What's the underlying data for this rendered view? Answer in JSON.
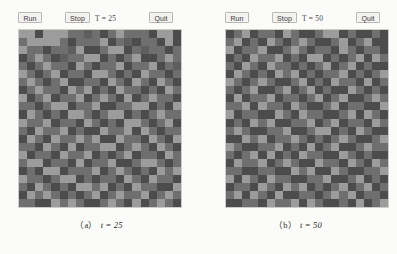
{
  "figure": {
    "panels": [
      {
        "id": "a",
        "caption_index": "（a）",
        "caption_text": "t = 25",
        "toolbar": {
          "run_label": "Run",
          "stop_label": "Stop",
          "quit_label": "Quit",
          "time_label": "T = 25"
        },
        "grid": {
          "columns": 20,
          "rows": 22,
          "palette": [
            "#4c4c4c",
            "#6f6f6f",
            "#9c9c9c",
            "#5e5e5e",
            "#868686"
          ],
          "cells": [
            2,
            2,
            0,
            2,
            2,
            2,
            1,
            1,
            3,
            1,
            0,
            1,
            2,
            1,
            1,
            1,
            0,
            2,
            2,
            0,
            1,
            2,
            2,
            2,
            2,
            1,
            0,
            1,
            1,
            1,
            2,
            0,
            1,
            3,
            0,
            1,
            1,
            0,
            2,
            0,
            2,
            1,
            1,
            0,
            1,
            1,
            3,
            2,
            0,
            0,
            1,
            2,
            2,
            0,
            1,
            3,
            1,
            1,
            0,
            1,
            0,
            1,
            2,
            1,
            0,
            3,
            1,
            1,
            2,
            2,
            0,
            1,
            0,
            1,
            2,
            0,
            0,
            1,
            2,
            1,
            1,
            0,
            1,
            2,
            1,
            1,
            0,
            2,
            1,
            0,
            1,
            1,
            2,
            0,
            1,
            1,
            2,
            0,
            1,
            3,
            2,
            1,
            0,
            1,
            2,
            0,
            1,
            1,
            0,
            2,
            2,
            1,
            0,
            1,
            0,
            2,
            1,
            1,
            0,
            1,
            1,
            2,
            1,
            0,
            1,
            2,
            0,
            0,
            1,
            1,
            0,
            2,
            1,
            0,
            2,
            1,
            0,
            2,
            1,
            0,
            0,
            1,
            2,
            1,
            1,
            0,
            2,
            1,
            2,
            0,
            1,
            0,
            2,
            1,
            1,
            0,
            1,
            0,
            2,
            1,
            2,
            0,
            1,
            2,
            0,
            1,
            1,
            2,
            0,
            1,
            2,
            1,
            0,
            2,
            0,
            1,
            2,
            1,
            1,
            0,
            1,
            1,
            0,
            1,
            2,
            2,
            0,
            1,
            1,
            2,
            0,
            0,
            1,
            1,
            2,
            2,
            0,
            1,
            0,
            2,
            0,
            2,
            1,
            0,
            1,
            0,
            2,
            2,
            1,
            0,
            1,
            2,
            2,
            0,
            1,
            0,
            1,
            2,
            1,
            1,
            2,
            1,
            1,
            2,
            0,
            1,
            1,
            0,
            2,
            1,
            0,
            1,
            0,
            2,
            2,
            1,
            0,
            1,
            2,
            0,
            1,
            0,
            2,
            1,
            1,
            2,
            0,
            1,
            0,
            0,
            2,
            1,
            1,
            2,
            0,
            2,
            1,
            0,
            1,
            1,
            0,
            2,
            1,
            0,
            2,
            1,
            1,
            2,
            1,
            2,
            0,
            0,
            2,
            1,
            1,
            0,
            2,
            1,
            0,
            2,
            1,
            1,
            0,
            2,
            1,
            0,
            2,
            0,
            1,
            1,
            2,
            2,
            0,
            1,
            2,
            1,
            0,
            2,
            1,
            0,
            2,
            0,
            1,
            1,
            0,
            2,
            1,
            1,
            2,
            0,
            1,
            0,
            1,
            2,
            0,
            1,
            1,
            0,
            2,
            1,
            1,
            2,
            2,
            0,
            1,
            1,
            0,
            2,
            0,
            1,
            1,
            2,
            0,
            0,
            1,
            2,
            2,
            1,
            0,
            1,
            0,
            1,
            0,
            2,
            2,
            0,
            1,
            1,
            1,
            2,
            0,
            1,
            2,
            1,
            0,
            1,
            0,
            2,
            1,
            2,
            2,
            1,
            1,
            0,
            1,
            2,
            2,
            0,
            1,
            0,
            1,
            1,
            0,
            2,
            1,
            0,
            2,
            1,
            1,
            0,
            1,
            0,
            2,
            1,
            0,
            1,
            0,
            2,
            2,
            1,
            2,
            0,
            1,
            0,
            2,
            1,
            1,
            0,
            0,
            2,
            0,
            2,
            1,
            2,
            1,
            0,
            1,
            0,
            1,
            2,
            0,
            1,
            2,
            1,
            1,
            2,
            0,
            1,
            2,
            1,
            1,
            1,
            0,
            0,
            2,
            1,
            2,
            1,
            0,
            0,
            1,
            2,
            1,
            0,
            2,
            0,
            1,
            2,
            1,
            0
          ]
        }
      },
      {
        "id": "b",
        "caption_index": "（b）",
        "caption_text": "t = 50",
        "toolbar": {
          "run_label": "Run",
          "stop_label": "Stop",
          "quit_label": "Quit",
          "time_label": "T = 50"
        },
        "grid": {
          "columns": 20,
          "rows": 22,
          "palette": [
            "#4c4c4c",
            "#6f6f6f",
            "#9c9c9c",
            "#5e5e5e",
            "#868686"
          ],
          "cells": [
            0,
            1,
            2,
            0,
            1,
            1,
            0,
            2,
            1,
            0,
            0,
            1,
            2,
            2,
            0,
            1,
            0,
            0,
            1,
            0,
            1,
            2,
            0,
            1,
            0,
            2,
            1,
            0,
            1,
            2,
            1,
            0,
            0,
            1,
            2,
            0,
            1,
            2,
            0,
            0,
            2,
            0,
            1,
            1,
            2,
            0,
            0,
            1,
            2,
            1,
            0,
            1,
            1,
            0,
            2,
            1,
            0,
            1,
            1,
            0,
            0,
            1,
            0,
            2,
            1,
            1,
            2,
            0,
            1,
            0,
            2,
            2,
            0,
            1,
            0,
            1,
            2,
            0,
            2,
            1,
            1,
            0,
            2,
            1,
            0,
            2,
            1,
            1,
            0,
            1,
            0,
            1,
            2,
            0,
            1,
            2,
            0,
            1,
            0,
            0,
            0,
            2,
            1,
            0,
            1,
            0,
            2,
            1,
            2,
            0,
            1,
            0,
            1,
            1,
            2,
            0,
            1,
            0,
            1,
            2,
            2,
            1,
            0,
            1,
            2,
            1,
            0,
            0,
            1,
            2,
            0,
            1,
            0,
            2,
            1,
            1,
            0,
            2,
            0,
            1,
            1,
            0,
            1,
            2,
            0,
            0,
            1,
            2,
            0,
            1,
            2,
            0,
            1,
            0,
            0,
            2,
            1,
            0,
            1,
            0,
            0,
            2,
            0,
            1,
            1,
            2,
            0,
            1,
            1,
            0,
            1,
            2,
            0,
            1,
            2,
            0,
            0,
            1,
            2,
            1,
            1,
            1,
            2,
            0,
            2,
            1,
            1,
            0,
            2,
            1,
            0,
            0,
            1,
            2,
            0,
            1,
            1,
            0,
            0,
            2,
            2,
            0,
            1,
            1,
            0,
            0,
            2,
            1,
            0,
            2,
            1,
            1,
            0,
            0,
            1,
            2,
            0,
            2,
            1,
            0,
            0,
            1,
            0,
            2,
            1,
            2,
            0,
            0,
            1,
            1,
            2,
            0,
            1,
            2,
            0,
            1,
            1,
            0,
            2,
            1,
            1,
            2,
            1,
            0,
            0,
            1,
            1,
            2,
            0,
            0,
            1,
            2,
            2,
            0,
            1,
            0,
            2,
            1,
            0,
            0,
            0,
            0,
            2,
            1,
            2,
            0,
            1,
            1,
            2,
            1,
            0,
            1,
            0,
            1,
            2,
            1,
            0,
            0,
            1,
            2,
            2,
            1,
            0,
            0,
            1,
            1,
            2,
            0,
            1,
            0,
            2,
            0,
            1,
            2,
            0,
            0,
            1,
            2,
            1,
            1,
            1,
            0,
            1,
            2,
            0,
            2,
            0,
            1,
            0,
            2,
            1,
            1,
            0,
            0,
            2,
            1,
            0,
            1,
            0,
            0,
            0,
            2,
            1,
            1,
            2,
            0,
            1,
            2,
            1,
            0,
            0,
            2,
            1,
            1,
            0,
            2,
            1,
            0,
            2,
            1,
            1,
            1,
            0,
            0,
            1,
            1,
            0,
            0,
            2,
            1,
            2,
            0,
            0,
            2,
            1,
            0,
            0,
            1,
            1,
            2,
            2,
            0,
            2,
            1,
            0,
            2,
            1,
            1,
            0,
            0,
            1,
            1,
            2,
            0,
            0,
            1,
            2,
            0,
            1,
            0,
            0,
            1,
            1,
            0,
            2,
            1,
            0,
            2,
            1,
            2,
            0,
            1,
            0,
            1,
            2,
            0,
            1,
            2,
            0,
            1,
            1,
            2,
            0,
            2,
            1,
            0,
            2,
            0,
            0,
            1,
            1,
            0,
            1,
            2,
            1,
            2,
            0,
            1,
            1,
            0,
            0,
            0,
            1,
            1,
            0,
            2,
            1,
            1,
            2,
            0,
            2,
            1,
            0,
            0,
            1,
            0,
            2,
            0,
            1,
            2
          ]
        }
      }
    ]
  }
}
